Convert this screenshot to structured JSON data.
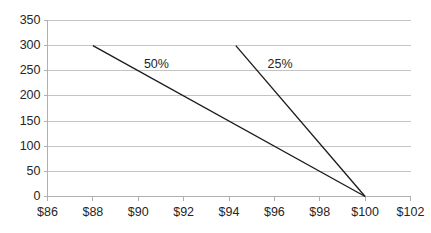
{
  "chart_data": {
    "type": "line",
    "title": "",
    "subtitle": "",
    "xlabel": "",
    "ylabel": "",
    "xlim": [
      86,
      102
    ],
    "ylim": [
      0,
      350
    ],
    "xticks": [
      86,
      88,
      90,
      92,
      94,
      96,
      98,
      100,
      102
    ],
    "xtick_labels": [
      "$86",
      "$88",
      "$90",
      "$92",
      "$94",
      "$96",
      "$98",
      "$100",
      "$102"
    ],
    "yticks": [
      0,
      50,
      100,
      150,
      200,
      250,
      300,
      350
    ],
    "ytick_labels": [
      "0",
      "50",
      "100",
      "150",
      "200",
      "250",
      "300",
      "350"
    ],
    "grid": true,
    "grid_axis": "y",
    "legend": "inline-annotations",
    "legend_position": "inside-plot",
    "series": [
      {
        "name": "50%",
        "label": "50%",
        "color": "#1c1c1c",
        "x": [
          88,
          100
        ],
        "y": [
          300,
          0
        ],
        "annotation": {
          "text": "50%",
          "x": 90.25,
          "y": 262
        }
      },
      {
        "name": "25%",
        "label": "25%",
        "color": "#1c1c1c",
        "x": [
          94.3,
          100
        ],
        "y": [
          300,
          0
        ],
        "annotation": {
          "text": "25%",
          "x": 95.7,
          "y": 262
        }
      }
    ],
    "colors": {
      "gridline": "#c4c4c4",
      "axis": "#b0b0b0",
      "series": "#1c1c1c",
      "text": "#262626",
      "background": "#ffffff"
    }
  }
}
